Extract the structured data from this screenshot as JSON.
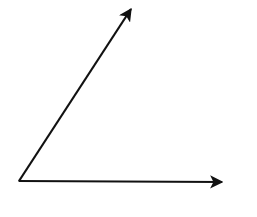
{
  "diagram": {
    "type": "angle",
    "vertex": {
      "x": 19,
      "y": 181
    },
    "rays": [
      {
        "name": "upper-ray",
        "end": {
          "x": 133,
          "y": 6
        }
      },
      {
        "name": "horizontal-ray",
        "end": {
          "x": 224,
          "y": 182
        }
      }
    ],
    "stroke_color": "#111111",
    "background": "#ffffff"
  }
}
